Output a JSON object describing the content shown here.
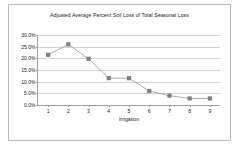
{
  "chart_data": {
    "type": "line",
    "title": "Adjusted Average Percent Soil Loss of Total Seasonal Loss",
    "xlabel": "Irrigation",
    "ylabel": "",
    "categories": [
      "1",
      "2",
      "3",
      "4",
      "5",
      "6",
      "7",
      "8",
      "9"
    ],
    "values": [
      21.5,
      26.0,
      19.8,
      11.5,
      11.5,
      6.0,
      4.0,
      2.8,
      2.8
    ],
    "series": [
      {
        "name": "Adjusted Average Percent Soil Loss",
        "values": [
          21.5,
          26.0,
          19.8,
          11.5,
          11.5,
          6.0,
          4.0,
          2.8,
          2.8
        ]
      }
    ],
    "ylim": [
      0.0,
      30.0
    ],
    "ytick_labels": [
      "30.0%",
      "25.0%",
      "20.0%",
      "15.0%",
      "10.0%",
      "5.0%",
      "0.0%"
    ],
    "ytick_values": [
      30.0,
      25.0,
      20.0,
      15.0,
      10.0,
      5.0,
      0.0
    ],
    "grid": true,
    "legend": "none",
    "marker": "square",
    "marker_color": "#808080",
    "line_color": "#999999",
    "plot_background": "#ffffff",
    "border_color": "#b9b9b9"
  }
}
